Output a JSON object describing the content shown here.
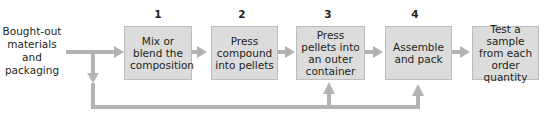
{
  "diagram": {
    "input_label": "Bought-out materials and packaging",
    "input_lines": [
      "Bought-out",
      "materials",
      "and",
      "packaging"
    ],
    "steps": [
      {
        "number": "1",
        "label": "Mix or blend the composition"
      },
      {
        "number": "2",
        "label": "Press compound into pellets"
      },
      {
        "number": "3",
        "label": "Press pellets into an outer container"
      },
      {
        "number": "4",
        "label": "Assemble and pack"
      },
      {
        "number": "",
        "label": "Test a sample from each order quantity"
      }
    ],
    "colors": {
      "box_fill": "#dcdcdc",
      "arrow": "#b3b3b3"
    }
  }
}
